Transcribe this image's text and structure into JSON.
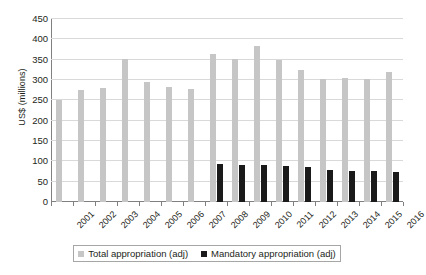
{
  "chart_data": {
    "type": "bar",
    "title": "",
    "subtitle": "",
    "xlabel": "",
    "ylabel": "US$ (millions)",
    "ylim": [
      0,
      450
    ],
    "ytick_step": 50,
    "yticks": [
      450,
      400,
      350,
      300,
      250,
      200,
      150,
      100,
      50,
      0
    ],
    "grid": true,
    "legend_position": "bottom",
    "categories": [
      "2001",
      "2002",
      "2003",
      "2004",
      "2005",
      "2006",
      "2007",
      "2008",
      "2009",
      "2010",
      "2011",
      "2012",
      "2013",
      "2014",
      "2015",
      "2016"
    ],
    "series": [
      {
        "name": "Total appropriation (adj)",
        "color": "#c6c6c6",
        "values": [
          252,
          275,
          280,
          352,
          296,
          283,
          278,
          365,
          352,
          383,
          348,
          325,
          302,
          305,
          303,
          320
        ]
      },
      {
        "name": "Mandatory appropriation (adj)",
        "color": "#1a1a1a",
        "values": [
          null,
          null,
          null,
          null,
          null,
          null,
          null,
          94,
          91,
          90,
          89,
          86,
          79,
          77,
          76,
          75
        ]
      }
    ]
  },
  "legend": {
    "entries": [
      {
        "label": "Total appropriation (adj)",
        "swatch": "#c6c6c6"
      },
      {
        "label": "Mandatory appropriation (adj)",
        "swatch": "#1a1a1a"
      }
    ]
  },
  "axes": {
    "y_title": "US$ (millions)"
  }
}
